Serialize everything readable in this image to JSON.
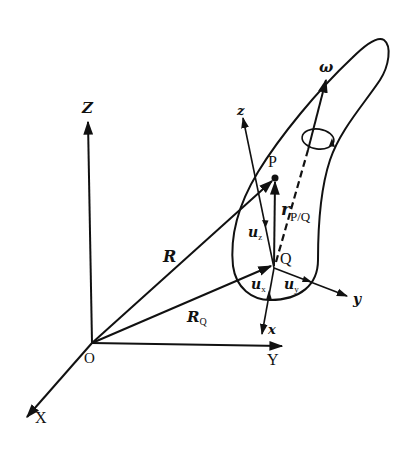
{
  "diagram": {
    "type": "rigid-body-kinematics",
    "global_axes": {
      "origin": "O",
      "x": "X",
      "y": "Y",
      "z": "Z"
    },
    "body_axes": {
      "origin": "Q",
      "x": "x",
      "y": "y",
      "z": "z"
    },
    "points": {
      "P": "P",
      "Q": "Q"
    },
    "vectors": {
      "R": "R",
      "R_Q": {
        "base": "R",
        "sub": "Q"
      },
      "r_PQ": {
        "base": "r",
        "sub": "P/Q"
      },
      "omega": "ω"
    },
    "unit_vectors": {
      "u_x": {
        "base": "u",
        "sub": "x"
      },
      "u_y": {
        "base": "u",
        "sub": "y"
      },
      "u_z": {
        "base": "u",
        "sub": "z"
      }
    },
    "colors": {
      "ink": "#111111",
      "background": "#ffffff"
    }
  }
}
